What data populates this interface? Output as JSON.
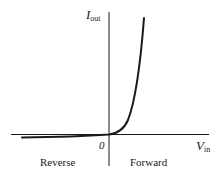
{
  "diagram": {
    "type": "diode I-V characteristic",
    "y_axis": {
      "symbol": "I",
      "subscript": "out"
    },
    "x_axis": {
      "symbol": "V",
      "subscript": "in"
    },
    "origin_label": "0",
    "regions": {
      "left": "Reverse",
      "right": "Forward"
    },
    "colors": {
      "ink": "#1a1a1a",
      "background": "#ffffff"
    }
  }
}
